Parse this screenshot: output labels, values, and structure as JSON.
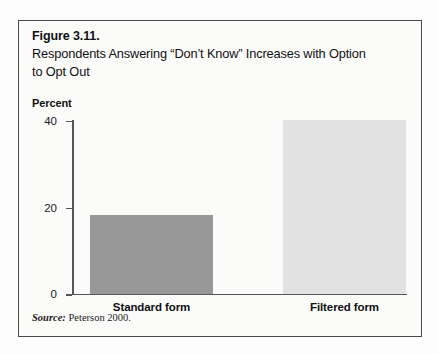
{
  "figure": {
    "number": "Figure 3.11.",
    "title": "Respondents Answering “Don’t Know” Increases with Option to Opt Out",
    "source_word": "Source:",
    "source_text": " Peterson 2000."
  },
  "colors": {
    "border": "#4a4a4a",
    "axis": "#55565a",
    "bar_standard": "#989898",
    "bar_filtered": "#e2e2e2",
    "background": "#fbfbfa",
    "text": "#111111"
  },
  "chart_data": {
    "type": "bar",
    "title": "Respondents Answering “Don’t Know” Increases with Option to Opt Out",
    "categories": [
      "Standard form",
      "Filtered form"
    ],
    "values": [
      18,
      40
    ],
    "xlabel": "",
    "ylabel": "Percent",
    "ylim": [
      0,
      40
    ],
    "yticks": [
      "0",
      "20",
      "40"
    ],
    "ytick_values": [
      0,
      20,
      40
    ],
    "grid": false,
    "legend": "none",
    "bar_colors": [
      "#989898",
      "#e2e2e2"
    ],
    "source": "Source: Peterson 2000."
  }
}
